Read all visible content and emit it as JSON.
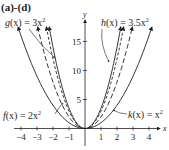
{
  "header": {
    "part_label": "(a)-(d)"
  },
  "chart_data": {
    "type": "line",
    "title": "(a)-(d)",
    "xlabel": "x",
    "ylabel": "y",
    "xlim": [
      -4.3,
      4.8
    ],
    "ylim": [
      0,
      17.5
    ],
    "x_ticks": [
      -4,
      -3,
      -2,
      -1,
      1,
      2,
      3,
      4
    ],
    "x_tick_labels": [
      "−4",
      "−3",
      "−2",
      "−1",
      "1",
      "2",
      "3",
      "4"
    ],
    "y_ticks": [
      5,
      10,
      15
    ],
    "y_tick_labels": [
      "5",
      "10",
      "15"
    ],
    "grid": false,
    "series": [
      {
        "name": "f(x) = 2x²",
        "coef": 2,
        "style": "dashed-long",
        "label_pos": "left-bottom"
      },
      {
        "name": "g(x) = 3x²",
        "coef": 3,
        "style": "dashed-short",
        "label_pos": "left-top"
      },
      {
        "name": "h(x) = 3.5x²",
        "coef": 3.5,
        "style": "solid",
        "label_pos": "right-top"
      },
      {
        "name": "k(x) = x²",
        "coef": 1,
        "style": "solid",
        "label_pos": "right-bottom"
      }
    ],
    "labels": {
      "f": {
        "fn": "f",
        "arg": "(x)",
        "eq": " = 2x",
        "exp": "2"
      },
      "g": {
        "fn": "g",
        "arg": "(x)",
        "eq": " = 3x",
        "exp": "2"
      },
      "h": {
        "fn": "h",
        "arg": "(x)",
        "eq": " = 3.5x",
        "exp": "2"
      },
      "k": {
        "fn": "k",
        "arg": "(x)",
        "eq": " = x",
        "exp": "2"
      }
    },
    "colors": {
      "ink": "#231f20",
      "background": "#ffffff"
    }
  }
}
